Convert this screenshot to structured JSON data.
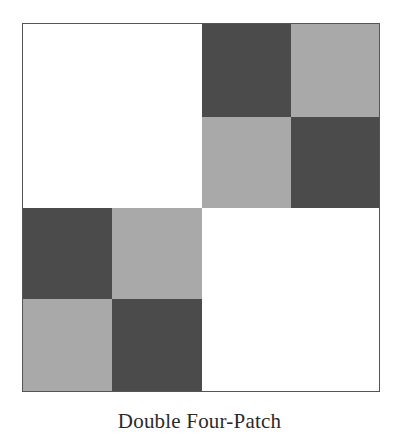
{
  "figure": {
    "caption": "Double Four-Patch",
    "colors": {
      "dark": "#4b4b4b",
      "light": "#a9a9a9",
      "white": "#ffffff",
      "border": "#555555"
    },
    "grid": {
      "description": "2x2 block: top-left and bottom-right plain white squares; top-right and bottom-left are four-patches of dark/light squares",
      "quadrants": [
        {
          "position": "top-left",
          "type": "plain",
          "color": "white"
        },
        {
          "position": "top-right",
          "type": "four-patch",
          "cells": [
            [
              "dark",
              "light"
            ],
            [
              "light",
              "dark"
            ]
          ]
        },
        {
          "position": "bottom-left",
          "type": "four-patch",
          "cells": [
            [
              "dark",
              "light"
            ],
            [
              "light",
              "dark"
            ]
          ]
        },
        {
          "position": "bottom-right",
          "type": "plain",
          "color": "white"
        }
      ]
    }
  }
}
